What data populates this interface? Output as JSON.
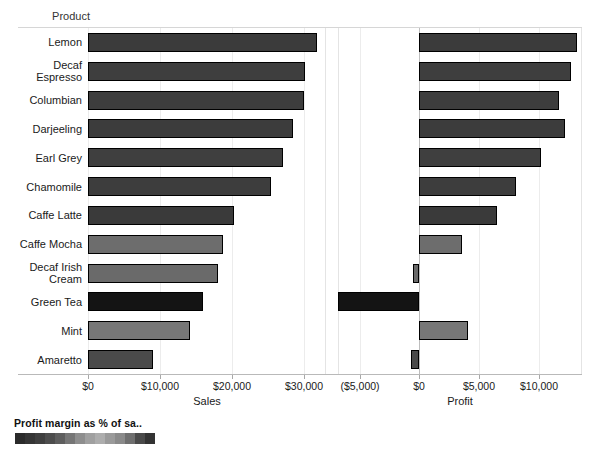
{
  "header": {
    "dimension_label": "Product"
  },
  "legend": {
    "title": "Profit margin as % of sa..",
    "swatches": [
      "#2b2b2b",
      "#353535",
      "#3f3f3f",
      "#4d4d4d",
      "#5e5e5e",
      "#767676",
      "#8e8e8e",
      "#a0a0a0",
      "#adadad",
      "#9a9a9a",
      "#8a8a8a",
      "#6f6f6f",
      "#4a4a4a",
      "#333333"
    ]
  },
  "chart_data": {
    "type": "bar",
    "title": "",
    "orientation": "horizontal",
    "grid": true,
    "legend_position": "bottom-left",
    "categories": [
      "Lemon",
      "Decaf Espresso",
      "Columbian",
      "Darjeeling",
      "Earl Grey",
      "Chamomile",
      "Caffe Latte",
      "Caffe Mocha",
      "Decaf Irish Cream",
      "Green Tea",
      "Mint",
      "Amaretto"
    ],
    "panels": [
      {
        "name": "sales",
        "xlabel": "Sales",
        "tick_labels": [
          "$0",
          "$10,000",
          "$20,000",
          "$30,000"
        ],
        "tick_values": [
          0,
          10000,
          20000,
          30000
        ],
        "xlim": [
          0,
          33000
        ],
        "values": [
          31800,
          30100,
          29900,
          28400,
          27000,
          25400,
          20300,
          18700,
          18000,
          15900,
          14100,
          9000
        ]
      },
      {
        "name": "profit",
        "xlabel": "Profit",
        "tick_labels": [
          "($5,000)",
          "$0",
          "$5,000",
          "$10,000"
        ],
        "tick_values": [
          -5000,
          0,
          5000,
          10000
        ],
        "xlim": [
          -6800,
          13600
        ],
        "values": [
          13200,
          12700,
          11700,
          12200,
          10200,
          8100,
          6500,
          3600,
          -500,
          -6800,
          4100,
          -700
        ]
      }
    ],
    "bar_colors": [
      "#3b3b3b",
      "#3e3e3e",
      "#3d3d3d",
      "#3c3c3c",
      "#3f3f3f",
      "#3d3d3d",
      "#3a3a3a",
      "#6d6d6d",
      "#6a6a6a",
      "#141414",
      "#777777",
      "#4a4a4a"
    ]
  }
}
